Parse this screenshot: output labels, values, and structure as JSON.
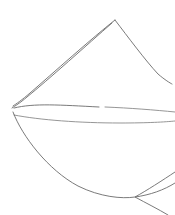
{
  "artwork": {
    "title": "Line Sketch",
    "background_color": "#ffffff",
    "canvas": {
      "width": 175,
      "height": 215
    },
    "ink_color": "#6b6b6b",
    "ink_color_light": "#8a8a8a",
    "stroke_width": 0.9,
    "key_points": {
      "apex": {
        "x": 115,
        "y": 20
      },
      "left_convergence": {
        "x": 13,
        "y": 107
      },
      "left_convergence_lower": {
        "x": 14,
        "y": 117
      },
      "right_upper_endpoint": {
        "x": 172,
        "y": 84
      },
      "bottom_crossing": {
        "x": 135,
        "y": 197
      }
    },
    "strokes": [
      {
        "name": "upper-left-ridge",
        "description": "long line from top apex down-left to left convergence point",
        "path": "M 115 20 C 92 38, 52 74, 30 93 C 22 100, 16 104, 13 106"
      },
      {
        "name": "upper-right-ridge",
        "description": "short line from top apex down-right toward right edge",
        "path": "M 115 20 C 128 37, 145 60, 158 74 C 165 80, 170 83, 172 84"
      },
      {
        "name": "inner-ridge",
        "description": "second line from near apex down-left to convergence, slightly below the upper-left ridge",
        "path": "M 112 23 C 88 44, 48 80, 27 97 C 20 103, 15 106, 12 108"
      },
      {
        "name": "lens-upper-curve",
        "description": "upper near-horizontal curve of the central lens, with a small gap near x=101",
        "path": "M 14 108 C 34 103, 60 105, 99 107"
      },
      {
        "name": "lens-upper-curve-right",
        "description": "continuation of upper lens curve after the gap, running to the right edge",
        "path": "M 105 107 C 130 108, 155 110, 175 112"
      },
      {
        "name": "lens-lower-curve",
        "description": "lower near-horizontal curve of the central lens running to the right edge",
        "path": "M 14 115 C 40 120, 80 123, 120 123 C 148 123, 165 122, 175 121"
      },
      {
        "name": "bottom-sweep",
        "description": "long curve from left convergence sweeping down and right to the bottom crossing and beyond",
        "path": "M 13 112 C 22 136, 48 170, 78 186 C 100 197, 122 199, 135 197 C 150 195, 164 190, 175 183"
      },
      {
        "name": "bottom-right-tail",
        "description": "stroke descending from right edge through the bottom crossing to the lower right corner",
        "path": "M 175 172 C 163 180, 146 191, 135 197 C 146 203, 158 209, 168 215"
      }
    ]
  }
}
